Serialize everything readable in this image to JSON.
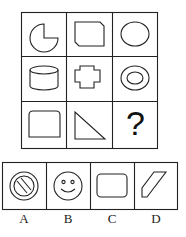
{
  "puzzle": {
    "grid": {
      "rows": 3,
      "cols": 3,
      "cells": [
        {
          "row": 1,
          "col": 1,
          "shape": "circle-with-quarter-cut"
        },
        {
          "row": 1,
          "col": 2,
          "shape": "chamfered-rectangle"
        },
        {
          "row": 1,
          "col": 3,
          "shape": "ellipse"
        },
        {
          "row": 2,
          "col": 1,
          "shape": "cylinder"
        },
        {
          "row": 2,
          "col": 2,
          "shape": "cross-polygon"
        },
        {
          "row": 2,
          "col": 3,
          "shape": "double-ellipse-ring"
        },
        {
          "row": 3,
          "col": 1,
          "shape": "rounded-top-rectangle"
        },
        {
          "row": 3,
          "col": 2,
          "shape": "right-triangle"
        },
        {
          "row": 3,
          "col": 3,
          "shape": "question-mark",
          "text": "?"
        }
      ]
    },
    "options": [
      {
        "label": "A",
        "shape": "ring-with-diagonal-bars"
      },
      {
        "label": "B",
        "shape": "smiley-face"
      },
      {
        "label": "C",
        "shape": "rounded-rectangle"
      },
      {
        "label": "D",
        "shape": "parallelogram"
      }
    ]
  }
}
